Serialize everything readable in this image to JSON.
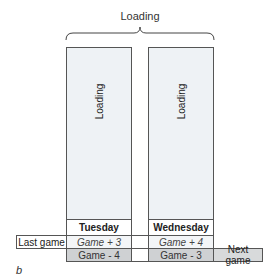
{
  "top_label": "Loading",
  "columns": [
    {
      "bar_label": "Loading",
      "day": "Tuesday",
      "plus": "Game + 3",
      "minus": "Game - 4"
    },
    {
      "bar_label": "Loading",
      "day": "Wednesday",
      "plus": "Game + 4",
      "minus": "Game - 3"
    }
  ],
  "side_labels": {
    "left": "Last game",
    "right": "Next game"
  },
  "figure_letter": "b",
  "colors": {
    "bar_fill": "#eef2f5",
    "minus_fill": "#cfd1d3",
    "border": "#555555"
  }
}
